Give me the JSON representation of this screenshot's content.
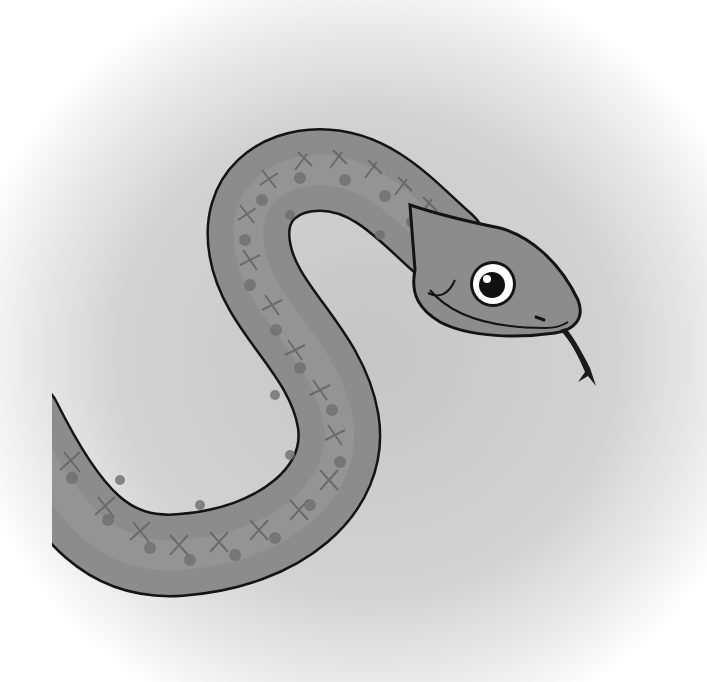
{
  "image": {
    "subject": "cartoon snake",
    "style": "grayscale illustration",
    "colors": {
      "background_center": "#c9c9c9",
      "background_edge": "#ffffff",
      "body_fill": "#8a8a8a",
      "body_light": "#a4a4a4",
      "pattern_dark": "#6e6e6e",
      "outline": "#141414",
      "eye_white": "#ffffff",
      "pupil": "#111111",
      "tongue": "#1a1a1a"
    }
  }
}
